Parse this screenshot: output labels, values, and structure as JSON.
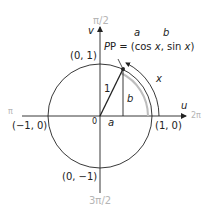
{
  "diagram": {
    "axes": {
      "horizontal_label": "u",
      "vertical_label": "v",
      "origin_label": "0"
    },
    "angle_labels": {
      "top": "π/2",
      "left": "π",
      "bottom": "3π/2",
      "right": "2π"
    },
    "points": {
      "top": "(0, 1)",
      "left": "(−1, 0)",
      "bottom": "(0, −1)",
      "right": "(1, 0)"
    },
    "point_p": {
      "prefix": "P = (cos ",
      "x1": "x",
      "mid": ", sin ",
      "x2": "x",
      "suffix": ")",
      "annot_a": "a",
      "annot_b": "b"
    },
    "segments": {
      "radius_label": "1",
      "height_label": "b",
      "base_label": "a",
      "arc_label": "x"
    },
    "colors": {
      "line": "#222222",
      "arc_highlight": "#bdbdbd",
      "angle_label": "#b5b5b5"
    }
  }
}
